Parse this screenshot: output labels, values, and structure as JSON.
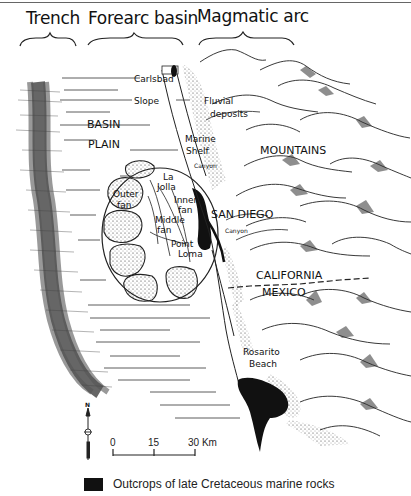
{
  "header": {
    "zones": [
      {
        "label": "Trench"
      },
      {
        "label": "Forearc basin"
      },
      {
        "label": "Magmatic arc"
      }
    ]
  },
  "labels": {
    "carlsbad": "Carlsbad",
    "slope": "Slope",
    "fluvial": "Fluvial",
    "deposits": "deposits",
    "basin": "BASIN",
    "plain": "PLAIN",
    "marine": "Marine",
    "shelf": "Shelf",
    "canyon1": "Canyon",
    "mountains": "MOUNTAINS",
    "outer": "Outer",
    "fan": "fan",
    "la": "La",
    "jolla": "Jolla",
    "inner": "Inner",
    "inner_fan": "fan",
    "middle": "Middle",
    "middle_fan": "fan",
    "point": "Point",
    "loma": "Loma",
    "san_diego": "SAN DIEGO",
    "canyon2": "Canyon",
    "california": "CALIFORNIA",
    "mexico": "MEXICO",
    "rosarito": "Rosarito",
    "beach": "Beach"
  },
  "north_arrow": {
    "label": "N"
  },
  "scale_bar": {
    "ticks": [
      "0",
      "15",
      "30 Km"
    ]
  },
  "legend": {
    "swatch_color": "#111111",
    "text": "Outcrops of late Cretaceous marine rocks"
  },
  "colors": {
    "ink": "#111111",
    "background": "#ffffff"
  }
}
